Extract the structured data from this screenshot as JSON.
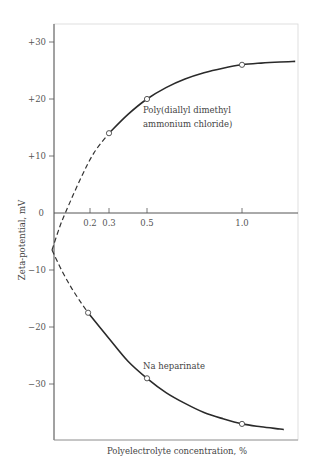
{
  "chart_data": {
    "type": "line",
    "title": "",
    "xlabel": "Polyelectrolyte  concentration, %",
    "ylabel": "Zeta-potential, mV",
    "xlim": [
      0,
      1.3
    ],
    "ylim": [
      -39,
      33
    ],
    "grid": false,
    "legend": "none (inline annotations)",
    "x_ticks": [
      {
        "value": 0.2,
        "label": "0.2"
      },
      {
        "value": 0.3,
        "label": "0.3"
      },
      {
        "value": 0.5,
        "label": "0.5"
      },
      {
        "value": 1.0,
        "label": "1.0"
      }
    ],
    "y_ticks": [
      {
        "value": 30,
        "label": "+30"
      },
      {
        "value": 20,
        "label": "+20"
      },
      {
        "value": 10,
        "label": "+10"
      },
      {
        "value": 0,
        "label": "0"
      },
      {
        "value": -10,
        "label": "−10"
      },
      {
        "value": -20,
        "label": "−20"
      },
      {
        "value": -30,
        "label": "−30"
      }
    ],
    "series": [
      {
        "name": "Poly(diallyl dimethyl ammonium chloride)",
        "label_lines": [
          "Poly(diallyl  dimethyl",
          "ammonium chloride)"
        ],
        "points": [
          {
            "x": 0.3,
            "y": 14
          },
          {
            "x": 0.5,
            "y": 20
          },
          {
            "x": 1.0,
            "y": 26
          }
        ],
        "dashed_curve": [
          [
            0,
            -6.5
          ],
          [
            0.04,
            -2.5
          ],
          [
            0.07,
            0
          ],
          [
            0.15,
            6
          ],
          [
            0.22,
            10.5
          ],
          [
            0.3,
            14
          ]
        ],
        "solid_curve": [
          [
            0.3,
            14
          ],
          [
            0.4,
            17.3
          ],
          [
            0.5,
            20
          ],
          [
            0.6,
            22
          ],
          [
            0.7,
            23.5
          ],
          [
            0.8,
            24.6
          ],
          [
            0.9,
            25.4
          ],
          [
            1.0,
            26
          ],
          [
            1.1,
            26.3
          ],
          [
            1.2,
            26.5
          ],
          [
            1.28,
            26.6
          ]
        ]
      },
      {
        "name": "Na heparinate",
        "label_lines": [
          "Na  heparinate"
        ],
        "points": [
          {
            "x": 0.19,
            "y": -17.5
          },
          {
            "x": 0.5,
            "y": -29
          },
          {
            "x": 1.0,
            "y": -37
          }
        ],
        "dashed_curve": [
          [
            0,
            -6.5
          ],
          [
            0.05,
            -10
          ],
          [
            0.1,
            -13
          ],
          [
            0.15,
            -15.6
          ],
          [
            0.19,
            -17.5
          ]
        ],
        "solid_curve": [
          [
            0.19,
            -17.5
          ],
          [
            0.3,
            -22
          ],
          [
            0.4,
            -26
          ],
          [
            0.5,
            -29
          ],
          [
            0.6,
            -31.5
          ],
          [
            0.7,
            -33.4
          ],
          [
            0.8,
            -35
          ],
          [
            0.9,
            -36.1
          ],
          [
            1.0,
            -37
          ],
          [
            1.1,
            -37.5
          ],
          [
            1.2,
            -37.9
          ],
          [
            1.22,
            -38
          ]
        ]
      }
    ]
  }
}
